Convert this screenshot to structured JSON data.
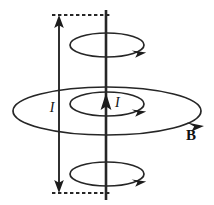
{
  "figure": {
    "type": "physics-diagram",
    "background_color": "#ffffff",
    "stroke_color": "#262626",
    "labels": {
      "current_left": "I",
      "current_wire": "I",
      "field": "B"
    },
    "elements": {
      "wire": {
        "name": "current-carrying-wire",
        "orientation": "vertical",
        "x": 106,
        "y_top": 10,
        "y_bottom": 200,
        "arrow_direction": "up",
        "arrow_tip_y": 96
      },
      "measure_arrow": {
        "name": "length-indicator",
        "x": 59,
        "y_top": 20,
        "y_bottom": 188,
        "heads": "double",
        "label": "I"
      },
      "guides": [
        {
          "name": "top-dashed-guide",
          "x1": 52,
          "x2": 112,
          "y": 15
        },
        {
          "name": "bottom-dashed-guide",
          "x1": 52,
          "x2": 112,
          "y": 193
        }
      ],
      "loops": [
        {
          "name": "upper-field-loop",
          "cx": 107,
          "cy": 45,
          "rx": 37,
          "ry": 12,
          "arrow_angle_deg": 35,
          "direction": "clockwise-viewed-from-above"
        },
        {
          "name": "inner-field-loop",
          "cx": 107,
          "cy": 104,
          "rx": 37,
          "ry": 12,
          "arrow_angle_deg": 35,
          "direction": "clockwise-viewed-from-above"
        },
        {
          "name": "outer-field-loop",
          "cx": 107,
          "cy": 111,
          "rx": 94,
          "ry": 24,
          "arrow_angle_deg": 35,
          "direction": "clockwise-viewed-from-above"
        },
        {
          "name": "lower-field-loop",
          "cx": 107,
          "cy": 174,
          "rx": 37,
          "ry": 12,
          "arrow_angle_deg": 35,
          "direction": "clockwise-viewed-from-above"
        }
      ],
      "label_positions": {
        "current_left": {
          "x": 52,
          "y": 112
        },
        "current_wire": {
          "x": 115,
          "y": 107
        },
        "field": {
          "x": 186,
          "y": 140
        }
      }
    }
  }
}
